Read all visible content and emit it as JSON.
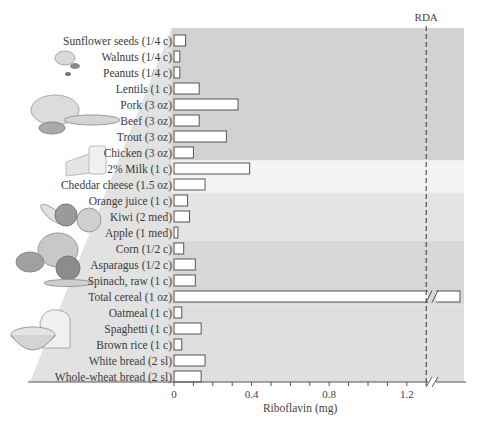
{
  "chart_data": {
    "type": "bar",
    "orientation": "horizontal",
    "title": "",
    "xlabel": "Riboflavin (mg)",
    "ylabel": "",
    "xlim": [
      0,
      1.45
    ],
    "x_ticks": [
      0,
      0.4,
      0.8,
      1.2
    ],
    "x_tick_labels": [
      "0",
      "0.4",
      "0.8",
      "1.2"
    ],
    "minor_tick_step": 0.1,
    "grid": false,
    "reference_line": {
      "label": "RDA",
      "value": 1.3,
      "style": "dashed"
    },
    "axis_break": {
      "after": 1.3,
      "symbol": "//"
    },
    "categories": [
      "Sunflower seeds (1/4 c)",
      "Walnuts (1/4 c)",
      "Peanuts (1/4 c)",
      "Lentils (1 c)",
      "Pork (3 oz)",
      "Beef (3 oz)",
      "Trout (3 oz)",
      "Chicken (3 oz)",
      "2% Milk (1 c)",
      "Cheddar cheese (1.5 oz)",
      "Orange juice (1 c)",
      "Kiwi (2 med)",
      "Apple (1 med)",
      "Corn (1/2 c)",
      "Asparagus (1/2 c)",
      "Spinach, raw (1 c)",
      "Total cereal (1 oz)",
      "Oatmeal (1 c)",
      "Spaghetti (1 c)",
      "Brown rice (1 c)",
      "White bread (2 sl)",
      "Whole-wheat bread (2 sl)"
    ],
    "values": [
      0.06,
      0.03,
      0.03,
      0.13,
      0.33,
      0.13,
      0.27,
      0.1,
      0.39,
      0.16,
      0.07,
      0.08,
      0.02,
      0.05,
      0.11,
      0.11,
      1.7,
      0.04,
      0.14,
      0.04,
      0.16,
      0.14
    ],
    "broken_bars": [
      "Total cereal (1 oz)"
    ],
    "groups": [
      {
        "name": "Meat, fish, legumes & nuts",
        "from": 0,
        "to": 7,
        "color": "#d2d2d2"
      },
      {
        "name": "Milk",
        "from": 8,
        "to": 9,
        "color": "#f4f4f4"
      },
      {
        "name": "Fruits",
        "from": 10,
        "to": 12,
        "color": "#e4e4e4"
      },
      {
        "name": "Vegetables",
        "from": 13,
        "to": 16,
        "color": "#d8d8d8"
      },
      {
        "name": "Grains",
        "from": 17,
        "to": 21,
        "color": "#dfdfdf"
      }
    ],
    "colors": {
      "bar_fill": "#ffffff",
      "bar_stroke": "#555555",
      "axis": "#555555",
      "pyramid": "#e2e2e2",
      "rda_line": "#333333"
    }
  },
  "illustrations": [
    "nuts-illustration",
    "meat-fish-illustration",
    "cheese-milk-illustration",
    "fruit-illustration",
    "vegetable-illustration",
    "bread-cereal-illustration"
  ]
}
